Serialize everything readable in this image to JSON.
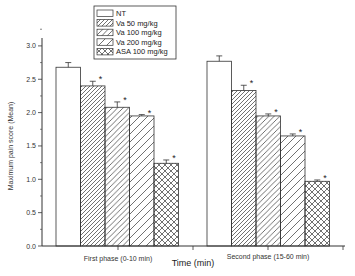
{
  "chart_data": {
    "type": "bar",
    "title": "",
    "xlabel": "Time (min)",
    "ylabel": "Maximum pain score (Mean)",
    "ylim": [
      0,
      3.25
    ],
    "yticks": [
      "0.0",
      "0.5",
      "1.0",
      "1.5",
      "2.0",
      "2.5",
      "3.0"
    ],
    "ytick_values": [
      0,
      0.5,
      1.0,
      1.5,
      2.0,
      2.5,
      3.0
    ],
    "categories": [
      "First phase (0-10 min)",
      "Second phase (15-60 min)"
    ],
    "legend_position": "top-left",
    "grid": false,
    "series": [
      {
        "name": "NT",
        "pattern": "none",
        "values": [
          2.68,
          2.77
        ],
        "errors": [
          0.07,
          0.08
        ],
        "significant": [
          false,
          false
        ]
      },
      {
        "name": "Va 50 mg/kg",
        "pattern": "dense-diagonal",
        "values": [
          2.4,
          2.33
        ],
        "errors": [
          0.07,
          0.08
        ],
        "significant": [
          true,
          true
        ]
      },
      {
        "name": "Va 100 mg/kg",
        "pattern": "medium-diagonal",
        "values": [
          2.08,
          1.95
        ],
        "errors": [
          0.08,
          0.03
        ],
        "significant": [
          true,
          true
        ]
      },
      {
        "name": "Va 200 mg/kg",
        "pattern": "sparse-diagonal",
        "values": [
          1.95,
          1.65
        ],
        "errors": [
          0.02,
          0.03
        ],
        "significant": [
          true,
          true
        ]
      },
      {
        "name": "ASA 100 mg/kg",
        "pattern": "crosshatch",
        "values": [
          1.24,
          0.97
        ],
        "errors": [
          0.05,
          0.02
        ],
        "significant": [
          true,
          true
        ]
      }
    ],
    "significance_marker": "*"
  }
}
